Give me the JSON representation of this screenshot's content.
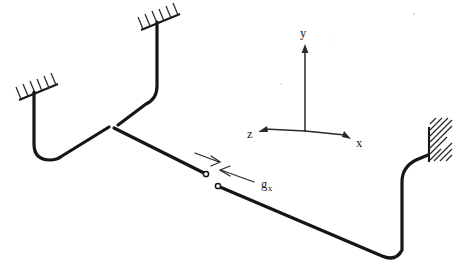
{
  "figure": {
    "kind": "piping-system-isometric-diagram",
    "background_color": "#ffffff",
    "line_color": "#161616",
    "label_color": "#1a1a1a",
    "hatch_color": "#2b2b2b"
  },
  "axes": {
    "origin": {
      "x": 305,
      "y": 130
    },
    "labels": {
      "y": "y",
      "x": "x",
      "z": "z"
    },
    "y_label_pos": {
      "x": 301,
      "y": 36
    },
    "x_label_pos": {
      "x": 357,
      "y": 146
    },
    "z_label_pos": {
      "x": 249,
      "y": 137
    },
    "y_tip": {
      "x": 305,
      "y": 46
    },
    "x_tip": {
      "x": 349,
      "y": 137
    },
    "z_tip": {
      "x": 259,
      "y": 131
    }
  },
  "gap": {
    "label": "g",
    "subscript": "x",
    "label_pos": {
      "x": 263,
      "y": 186
    },
    "node_a": {
      "x": 206,
      "y": 174
    },
    "node_b": {
      "x": 218,
      "y": 186
    },
    "node_radius": 2.6
  },
  "anchors": [
    {
      "name": "top-anchor",
      "style": "hatched-horizontal-bar",
      "x": 155,
      "y": 21
    },
    {
      "name": "left-anchor",
      "style": "hatched-horizontal-bar",
      "x": 33,
      "y": 91
    },
    {
      "name": "right-anchor",
      "style": "hatched-vertical-wall",
      "x": 434,
      "y": 144
    }
  ],
  "junction": {
    "name": "tee-junction",
    "x": 113,
    "y": 127
  }
}
